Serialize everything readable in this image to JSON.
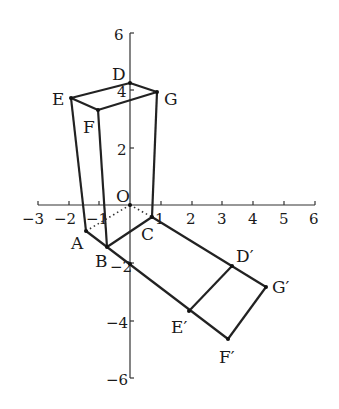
{
  "diagram": {
    "type": "coordinate-geometry-figure",
    "axes": {
      "x_ticks": [
        "−3",
        "−2",
        "−1",
        "1",
        "2",
        "3",
        "4",
        "5",
        "6"
      ],
      "y_ticks": [
        "6",
        "4",
        "2",
        "−2",
        "−4",
        "−6"
      ],
      "x_range": [
        -3,
        6
      ],
      "y_range": [
        -6,
        6
      ],
      "origin_label": "O"
    },
    "points": {
      "D": "D",
      "E": "E",
      "F": "F",
      "G": "G",
      "A": "A",
      "B": "B",
      "C": "C",
      "D_prime": "D′",
      "E_prime": "E′",
      "F_prime": "F′",
      "G_prime": "G′"
    },
    "edges": {
      "solid": [
        "E-D",
        "D-G",
        "E-F",
        "F-G",
        "E-A",
        "F-B",
        "G-C",
        "A-B",
        "B-C",
        "A-F′",
        "C-G′",
        "D′-E′",
        "G′-F′"
      ],
      "dotted": [
        "A-O",
        "O-C"
      ]
    }
  }
}
